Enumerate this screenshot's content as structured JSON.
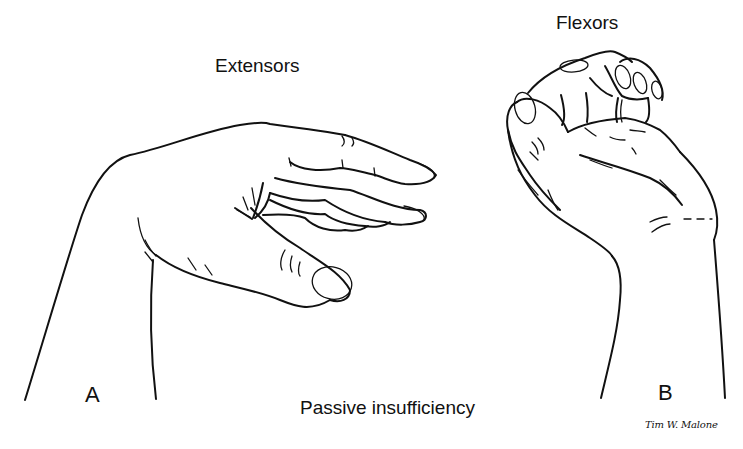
{
  "figure": {
    "caption": "Passive insufficiency",
    "signature": "Tim W. Malone",
    "panels": [
      {
        "id": "A",
        "label": "A",
        "muscle_group": "Extensors",
        "depiction": "hand-wrist-flexed-fingers-extended"
      },
      {
        "id": "B",
        "label": "B",
        "muscle_group": "Flexors",
        "depiction": "hand-wrist-extended-fingers-flexed"
      }
    ],
    "colors": {
      "background": "#ffffff",
      "ink": "#111111"
    }
  }
}
